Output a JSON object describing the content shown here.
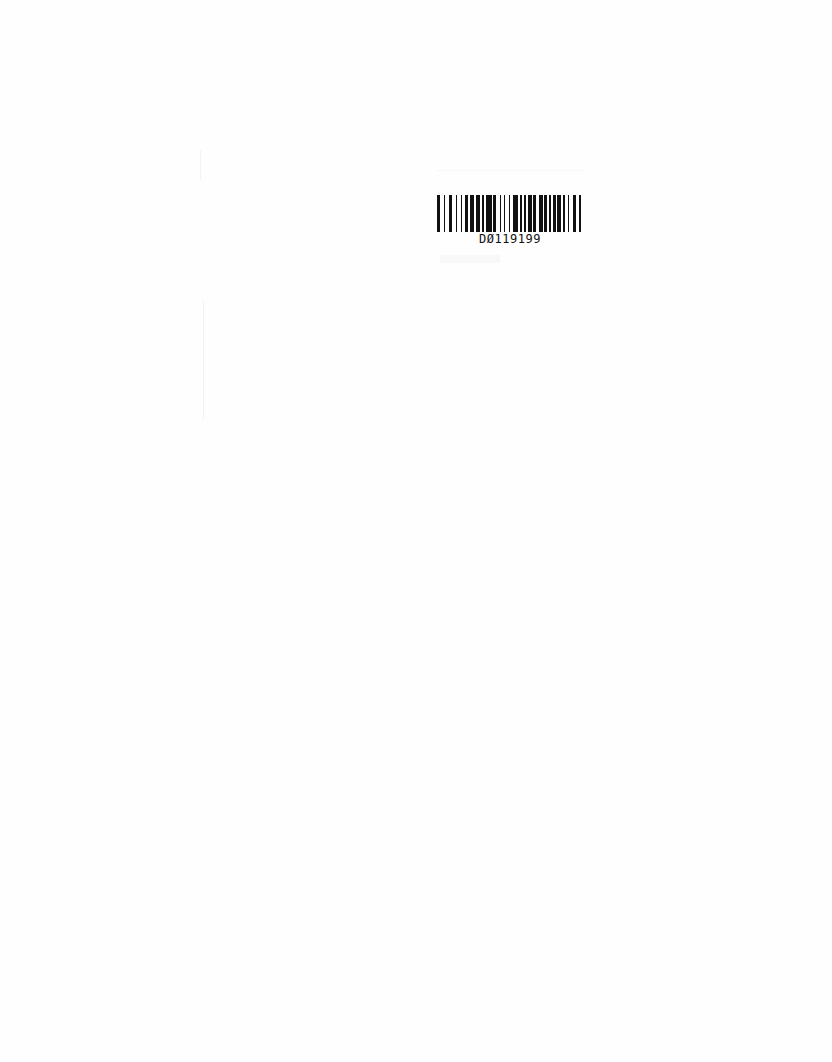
{
  "document": {
    "background": "#ffffff",
    "barcode": {
      "label": "D0119199",
      "display_label": "DØ119199",
      "bar_color": "#111111",
      "pattern": [
        2,
        3,
        1,
        3,
        2,
        3,
        1,
        3,
        1,
        2,
        2,
        2,
        3,
        1,
        3,
        2,
        1,
        2,
        4,
        1,
        2,
        3,
        1,
        2,
        1,
        3,
        1,
        2,
        4,
        1,
        2,
        1,
        2,
        1,
        3,
        1,
        2,
        2,
        3,
        1,
        2,
        2,
        1,
        2,
        2,
        1,
        3,
        1,
        2,
        2,
        1,
        3,
        2,
        2,
        2,
        1
      ]
    }
  }
}
